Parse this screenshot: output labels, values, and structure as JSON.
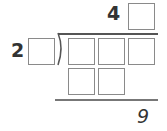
{
  "puzzle": {
    "type": "long-division",
    "quotient": {
      "digits": [
        "4",
        ""
      ],
      "blank_count": 1
    },
    "divisor": {
      "digits": [
        "2",
        ""
      ],
      "blank_count": 1
    },
    "dividend": {
      "digits": [
        "",
        "",
        ""
      ],
      "blank_count": 3
    },
    "subtraction_row": {
      "digits": [
        "",
        ""
      ],
      "blank_count": 2
    },
    "remainder": "9"
  },
  "colors": {
    "box_border": "#8a8a8a",
    "text": "#333333",
    "line": "#555555"
  }
}
